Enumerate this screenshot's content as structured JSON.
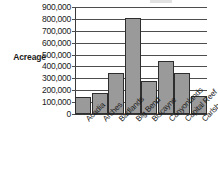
{
  "chart_data": {
    "type": "bar",
    "title": "",
    "xlabel": "",
    "ylabel": "Acreage",
    "categories": [
      "Acadia",
      "Arches",
      "Badlands",
      "Big Bend",
      "Biscayne",
      "Canyonlands",
      "Capital Reef",
      "Carlsbad Caverns"
    ],
    "values": [
      145000,
      175000,
      345000,
      805000,
      280000,
      445000,
      345000,
      155000
    ],
    "ylim": [
      0,
      900000
    ],
    "ytick_values": [
      0,
      100000,
      200000,
      300000,
      400000,
      500000,
      600000,
      700000,
      800000,
      900000
    ],
    "ytick_labels": [
      "0",
      "100,000",
      "200,000",
      "300,000",
      "400,000",
      "500,000",
      "600,000",
      "700,000",
      "800,000",
      "900,000"
    ],
    "grid": true,
    "legend": false,
    "legend_position": "none",
    "bar_color": "#9a9a9a",
    "bar_border_color": "#2e2e2e",
    "grid_color": "#4d4d4d",
    "axis_color": "#3a3a3a",
    "background_color": "#ffffff",
    "xlabel_rotation": -45
  }
}
